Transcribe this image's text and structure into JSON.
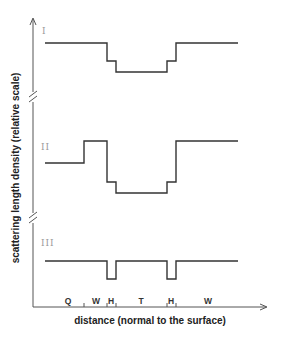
{
  "figure": {
    "y_axis_label": "scattering length density (relative scale)",
    "x_axis_label": "distance (normal to the surface)",
    "profiles": [
      {
        "label": "I",
        "points": "45,43 107,43 107,61 116,61 116,72 167,72 167,61 176,61 176,43 238,43"
      },
      {
        "label": "II",
        "points": "45,163 84,163 84,141 107,141 107,182 116,182 116,193 167,193 167,182 176,182 176,141 238,141"
      },
      {
        "label": "III",
        "points": "45,261 107,261 107,279 116,279 116,261 167,261 167,279 176,279 176,261 238,261"
      }
    ],
    "regions": [
      {
        "label": "Q",
        "x": 68
      },
      {
        "label": "W",
        "x": 96
      },
      {
        "label": "H",
        "x": 111
      },
      {
        "label": "T",
        "x": 141
      },
      {
        "label": "H",
        "x": 171
      },
      {
        "label": "W",
        "x": 208
      }
    ],
    "ticks": [
      84,
      107,
      116,
      167,
      176
    ],
    "colors": {
      "line": "#333333",
      "axis": "#555555",
      "roman_label": "#9a9a9a"
    }
  }
}
